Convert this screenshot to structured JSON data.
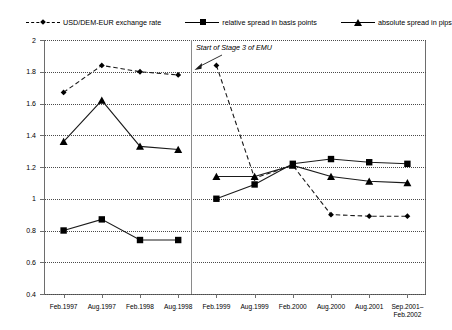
{
  "chart_data": {
    "type": "line",
    "title": "",
    "xlabel": "",
    "ylabel": "",
    "ylim": [
      0.4,
      2.0
    ],
    "ytick_step": 0.2,
    "grid": true,
    "legend_position": "top",
    "yticks": [
      "0.4",
      "0.6",
      "0.8",
      "1",
      "1.2",
      "1.4",
      "1.6",
      "1.8",
      "2"
    ],
    "categories": [
      "Feb.1997",
      "Aug.1997",
      "Feb.1998",
      "Aug.1998",
      "Feb.1999",
      "Aug.1999",
      "Feb.2000",
      "Aug.2000",
      "Aug.2001",
      "Sep.2001–\nFeb.2002"
    ],
    "series": [
      {
        "name": "USD/DEM-EUR exchange rate",
        "marker": "diamond",
        "linestyle": "dashed",
        "values": [
          1.67,
          1.84,
          1.8,
          1.78,
          1.84,
          1.13,
          1.21,
          0.9,
          0.89,
          0.89
        ]
      },
      {
        "name": "relative spread in basis points",
        "marker": "square",
        "linestyle": "solid",
        "values": [
          0.8,
          0.87,
          0.74,
          0.74,
          1.0,
          1.09,
          1.22,
          1.25,
          1.23,
          1.22
        ]
      },
      {
        "name": "absolute spread in pips",
        "marker": "triangle",
        "linestyle": "solid",
        "values": [
          1.36,
          1.62,
          1.33,
          1.31,
          1.14,
          1.14,
          1.21,
          1.14,
          1.11,
          1.1
        ]
      }
    ],
    "annotations": [
      {
        "text": "Start of Stage 3 of EMU",
        "points_to_category": "Feb.1999"
      }
    ],
    "divider": {
      "label": "Start of Stage 3 of EMU",
      "between": [
        "Aug.1998",
        "Feb.1999"
      ]
    }
  },
  "legend": {
    "items": [
      {
        "label": "USD/DEM-EUR exchange rate"
      },
      {
        "label": "relative spread in basis points"
      },
      {
        "label": "absolute spread in pips"
      }
    ]
  },
  "annotation": {
    "text": "Start of Stage 3 of EMU"
  }
}
